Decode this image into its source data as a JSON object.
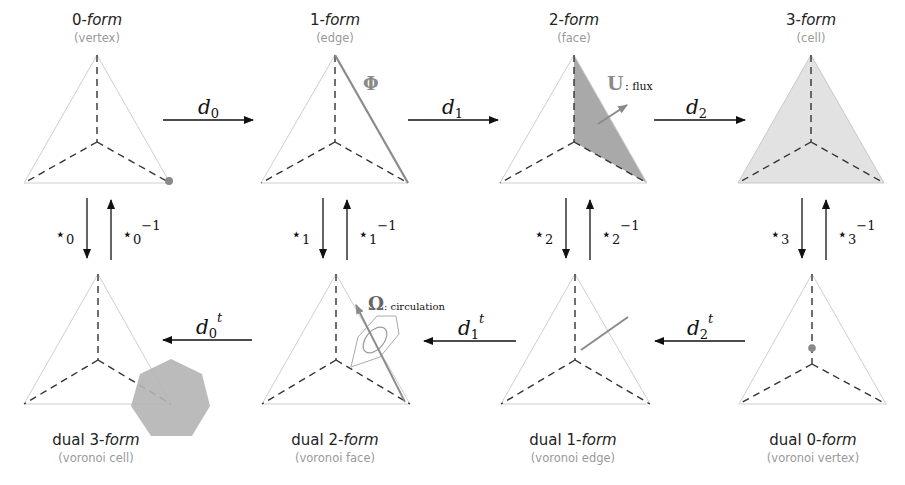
{
  "top_row": [
    {
      "number": "0-",
      "form": "form",
      "subtitle": "(vertex)"
    },
    {
      "number": "1-",
      "form": "form",
      "subtitle": "(edge)"
    },
    {
      "number": "2-",
      "form": "form",
      "subtitle": "(face)"
    },
    {
      "number": "3-",
      "form": "form",
      "subtitle": "(cell)"
    }
  ],
  "bottom_row": [
    {
      "number": "dual 3-",
      "form": "form",
      "subtitle": "(voronoi cell)"
    },
    {
      "number": "dual 2-",
      "form": "form",
      "subtitle": "(voronoi face)"
    },
    {
      "number": "dual 1-",
      "form": "form",
      "subtitle": "(voronoi edge)"
    },
    {
      "number": "dual 0-",
      "form": "form",
      "subtitle": "(voronoi vertex)"
    }
  ],
  "exterior_derivatives": [
    {
      "base": "d",
      "sub": "0"
    },
    {
      "base": "d",
      "sub": "1"
    },
    {
      "base": "d",
      "sub": "2"
    }
  ],
  "transposes": [
    {
      "base": "d",
      "sub": "0",
      "sup": "t"
    },
    {
      "base": "d",
      "sub": "1",
      "sup": "t"
    },
    {
      "base": "d",
      "sub": "2",
      "sup": "t"
    }
  ],
  "hodge_stars": [
    {
      "star": "⋆",
      "sub": "0",
      "inv": "−1"
    },
    {
      "star": "⋆",
      "sub": "1",
      "inv": "−1"
    },
    {
      "star": "⋆",
      "sub": "2",
      "inv": "−1"
    },
    {
      "star": "⋆",
      "sub": "3",
      "inv": "−1"
    }
  ],
  "annotations": {
    "phi": "Φ",
    "u": "U",
    "u_label": ": flux",
    "omega": "Ω",
    "omega_label": ": circulation"
  },
  "colors": {
    "highlight": "#8a8a8a",
    "face_fill": "#a9a9a9",
    "cell_fill": "#e2e2e2",
    "voronoi_cell_fill": "#b4b4b4"
  }
}
